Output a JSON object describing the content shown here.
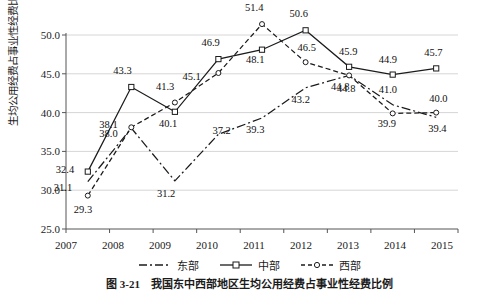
{
  "chart_data": {
    "type": "line",
    "title": "",
    "xlabel": "",
    "ylabel": "生均公用经费占事业性经费比例（%）",
    "categories": [
      "2007",
      "2008",
      "2009",
      "2010",
      "2011",
      "2012",
      "2013",
      "2014",
      "2015"
    ],
    "ylim": [
      25.0,
      50.0
    ],
    "yticks": [
      "25.0",
      "30.0",
      "35.0",
      "40.0",
      "45.0",
      "50.0"
    ],
    "grid": true,
    "legend_position": "bottom",
    "series": [
      {
        "name": "东部",
        "style": "dash-dot",
        "marker": "none",
        "color": "#1b1b1b",
        "values": [
          31.1,
          38.0,
          31.2,
          37.2,
          39.3,
          43.2,
          44.8,
          41.0,
          39.4
        ],
        "labels": [
          "31.1",
          "38.0",
          "31.2",
          "37.2",
          "39.3",
          "43.2",
          "44.8",
          "41.0",
          "39.4"
        ]
      },
      {
        "name": "中部",
        "style": "solid",
        "marker": "square",
        "color": "#1b1b1b",
        "values": [
          32.4,
          43.3,
          40.1,
          46.9,
          48.1,
          50.6,
          45.9,
          44.9,
          45.7
        ],
        "labels": [
          "32.4",
          "43.3",
          "40.1",
          "46.9",
          "48.1",
          "50.6",
          "45.9",
          "44.9",
          "45.7"
        ]
      },
      {
        "name": "西部",
        "style": "dashed",
        "marker": "circle",
        "color": "#1b1b1b",
        "values": [
          29.3,
          38.1,
          41.3,
          45.1,
          51.4,
          46.5,
          44.8,
          39.9,
          40.0
        ],
        "labels": [
          "29.3",
          "38.1",
          "41.3",
          "45.1",
          "51.4",
          "46.5",
          "44.8",
          "39.9",
          "40.0"
        ]
      }
    ]
  },
  "legend": {
    "items": [
      {
        "label": "东部"
      },
      {
        "label": "中部"
      },
      {
        "label": "西部"
      }
    ]
  },
  "caption": {
    "text": "图 3-21　我国东中西部地区生均公用经费占事业性经费比例"
  },
  "labels": {
    "zhongbu": [
      "32.4",
      "43.3",
      "40.1",
      "46.9",
      "48.1",
      "50.6",
      "45.9",
      "44.9",
      "45.7"
    ],
    "xibu": [
      "29.3",
      "38.1",
      "41.3",
      "45.1",
      "51.4",
      "46.5",
      "44.8",
      "39.9",
      "40.0"
    ],
    "dongbu": [
      "31.1",
      "38.0",
      "31.2",
      "37.2",
      "39.3",
      "43.2",
      "44.8",
      "41.0",
      "39.4"
    ]
  }
}
